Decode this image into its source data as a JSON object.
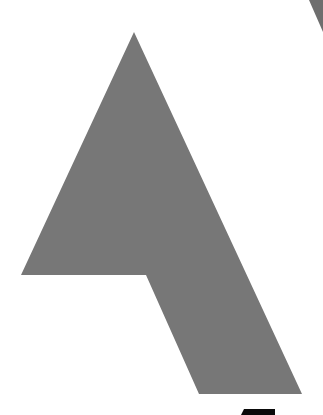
{
  "image": {
    "width": 323,
    "height": 415,
    "background": "#ffffff"
  },
  "shapes": {
    "main_arrow": {
      "fill": "#777777",
      "points": "134,32 21,275 146,275 199,394 302,394"
    },
    "top_right_wedge": {
      "fill": "#6e6e6e",
      "points": "309,0 323,0 323,32"
    },
    "bottom_black_block": {
      "fill": "#0a0a0a",
      "points": "244,409 275,409 275,415 241,415"
    }
  }
}
